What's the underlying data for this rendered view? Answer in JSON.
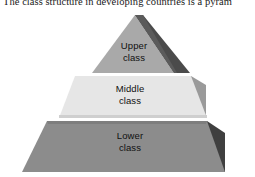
{
  "caption": {
    "text": "The class structure in developing countries is a pyram"
  },
  "figure": {
    "name": "class-structure-pyramid",
    "type": "3d-layered-pyramid",
    "layers": [
      {
        "id": "upper",
        "line1": "Upper",
        "line2": "class",
        "face_color": "#a9a9a9",
        "side_color": "#4b4b4b",
        "rank": 1
      },
      {
        "id": "middle",
        "line1": "Middle",
        "line2": "class",
        "face_color": "#e6e6e6",
        "side_color": "#9a9a9a",
        "rank": 2
      },
      {
        "id": "lower",
        "line1": "Lower",
        "line2": "class",
        "face_color": "#8c8c8c",
        "side_color": "#3f3f3f",
        "rank": 3
      }
    ],
    "background_color": "#ffffff",
    "text_color": "#101010"
  }
}
